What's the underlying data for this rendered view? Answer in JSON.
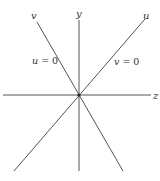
{
  "diagram": {
    "type": "coordinate-axes",
    "origin": {
      "x": 79,
      "y": 95
    },
    "axes": [
      {
        "name": "z",
        "label": "z",
        "from": [
          3,
          95
        ],
        "to": [
          151,
          95
        ],
        "label_pos": [
          156,
          98
        ]
      },
      {
        "name": "y",
        "label": "y",
        "from": [
          79,
          20
        ],
        "to": [
          79,
          171
        ],
        "label_pos": [
          79,
          15
        ]
      }
    ],
    "lines": [
      {
        "name": "u",
        "label": "u",
        "from": [
          145,
          19
        ],
        "to": [
          14,
          171
        ],
        "label_pos": [
          146,
          17
        ],
        "equation": {
          "var": "v",
          "eq": " = 0",
          "pos": [
            114,
            63
          ]
        }
      },
      {
        "name": "v",
        "label": "v",
        "from": [
          37,
          22
        ],
        "to": [
          123,
          171
        ],
        "label_pos": [
          33,
          17
        ],
        "equation": {
          "var": "u",
          "eq": " = 0",
          "pos": [
            32,
            62
          ]
        }
      }
    ],
    "colors": {
      "line": "#555555",
      "text": "#333333",
      "background": "#ffffff"
    }
  }
}
